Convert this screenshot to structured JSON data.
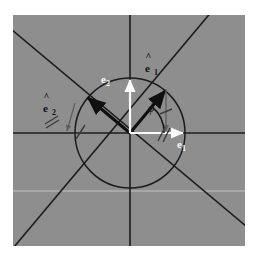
{
  "figure": {
    "type": "vector-diagram",
    "background_color": "#8e8e8e",
    "page_color": "#ffffff",
    "panel": {
      "x": 13,
      "y": 15,
      "width": 232,
      "height": 231
    },
    "geometry": {
      "origin": {
        "x": 117,
        "y": 118
      },
      "circle_radius": 55,
      "rotation_angle_deg": 50
    },
    "labels": {
      "e1_hat": {
        "base": "e",
        "hat": "^",
        "sub": "1",
        "color": "#121212",
        "x": 145,
        "y": 51
      },
      "e2_hat": {
        "base": "e",
        "hat": "^",
        "sub": "2",
        "color": "#121212",
        "x": 43,
        "y": 91
      },
      "e1": {
        "base": "e",
        "sub": "1",
        "color": "#fbfbfb",
        "x": 177,
        "y": 126
      },
      "e2": {
        "base": "e",
        "sub": "2",
        "color": "#fbfbfb",
        "x": 101,
        "y": 62
      },
      "phi": {
        "text": "ϕ",
        "color": "#141414",
        "x": 148,
        "y": 94
      }
    },
    "elements": [
      {
        "name": "background-square",
        "kind": "rect",
        "color": "#8e8e8e"
      },
      {
        "name": "horizontal-axis",
        "kind": "line",
        "color": "#1a1a1a"
      },
      {
        "name": "vertical-axis",
        "kind": "line",
        "color": "#1a1a1a"
      },
      {
        "name": "rotated-axis-1",
        "kind": "line",
        "color": "#1a1a1a"
      },
      {
        "name": "rotated-axis-2",
        "kind": "line",
        "color": "#1a1a1a"
      },
      {
        "name": "unit-circle",
        "kind": "circle",
        "color": "#1a1a1a"
      },
      {
        "name": "e1-hat-vector",
        "kind": "arrow",
        "color": "#101010"
      },
      {
        "name": "e2-hat-vector",
        "kind": "arrow",
        "color": "#101010"
      },
      {
        "name": "e1-vector",
        "kind": "arrow",
        "color": "#fbfbfb"
      },
      {
        "name": "e2-vector",
        "kind": "arrow",
        "color": "#fbfbfb"
      },
      {
        "name": "projection-arrow-vertical",
        "kind": "arrow",
        "color": "#606060"
      },
      {
        "name": "projection-arrow-diagonal",
        "kind": "arrow",
        "color": "#606060"
      },
      {
        "name": "angle-arc",
        "kind": "arc",
        "color": "#141414"
      },
      {
        "name": "tick-mark-single-left",
        "kind": "tick",
        "color": "#4a4a4a"
      },
      {
        "name": "tick-mark-single-right",
        "kind": "tick",
        "color": "#4a4a4a"
      },
      {
        "name": "hash-double-e2hat",
        "kind": "hash",
        "color": "#3c3c3c"
      },
      {
        "name": "hash-double-phi",
        "kind": "hash",
        "color": "#3c3c3c"
      },
      {
        "name": "faint-guide-line",
        "kind": "line",
        "color": "#d8d8d8"
      }
    ]
  }
}
